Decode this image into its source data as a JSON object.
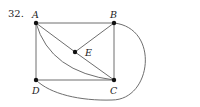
{
  "problem_number": "32.",
  "colors": {
    "edge": "#6e6e6e",
    "vertex": "#111111",
    "text": "#222222"
  },
  "graph": {
    "vertices": [
      {
        "id": "A",
        "label": "A",
        "x": 36,
        "y": 23
      },
      {
        "id": "B",
        "label": "B",
        "x": 114,
        "y": 23
      },
      {
        "id": "C",
        "label": "C",
        "x": 114,
        "y": 80
      },
      {
        "id": "D",
        "label": "D",
        "x": 36,
        "y": 80
      },
      {
        "id": "E",
        "label": "E",
        "x": 75,
        "y": 52
      }
    ],
    "edges": [
      {
        "from": "A",
        "to": "B",
        "type": "straight"
      },
      {
        "from": "A",
        "to": "D",
        "type": "straight"
      },
      {
        "from": "B",
        "to": "C",
        "type": "straight"
      },
      {
        "from": "D",
        "to": "C",
        "type": "straight"
      },
      {
        "from": "A",
        "to": "E",
        "type": "straight"
      },
      {
        "from": "E",
        "to": "C",
        "type": "straight"
      },
      {
        "from": "B",
        "to": "E",
        "type": "straight"
      },
      {
        "from": "A",
        "to": "C",
        "type": "curved"
      },
      {
        "from": "B",
        "to": "D",
        "type": "curved-outer"
      }
    ]
  }
}
